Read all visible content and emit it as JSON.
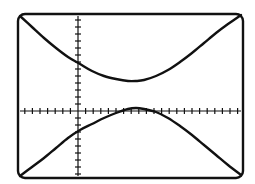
{
  "figure": {
    "kind": "graphing-calculator-screen",
    "title": "",
    "frame": {
      "x": 18,
      "y": 14,
      "width": 225,
      "height": 164,
      "corner_radius": 7,
      "stroke_color": "#111111",
      "stroke_width": 2.4,
      "fill_color": "#ffffff"
    },
    "background_color": "#ffffff",
    "curve_color": "#111111",
    "axis_color": "#111111"
  },
  "chart_data": {
    "type": "line",
    "title": "",
    "subtitle": "",
    "xlabel": "",
    "ylabel": "",
    "grid": false,
    "legend": "none",
    "axes": {
      "origin_px": {
        "x": 78,
        "y": 111
      },
      "x_axis": {
        "visible": true,
        "from_px": 20,
        "to_px": 241,
        "y_px": 111,
        "tick_spacing_px": 7.6,
        "tick_half_length_px": 3,
        "tick_count_left_of_origin": 7,
        "tick_count_right_of_origin": 21
      },
      "y_axis": {
        "visible": true,
        "x_px": 78,
        "from_px": 16,
        "to_px": 176,
        "tick_spacing_px": 7.0,
        "tick_half_length_px": 3,
        "tick_count_above_origin": 13,
        "tick_count_below_origin": 9
      },
      "xlim": [
        -7.6,
        21.4
      ],
      "ylim": [
        -9.3,
        13.6
      ]
    },
    "series": [
      {
        "name": "upper-branch",
        "comment": "upper branch of hyperbola, vertex near (135,81) px, rises to both frame corners",
        "points_px": [
          [
            20,
            16
          ],
          [
            32,
            27
          ],
          [
            44,
            38
          ],
          [
            56,
            48
          ],
          [
            68,
            57
          ],
          [
            80,
            64
          ],
          [
            92,
            71
          ],
          [
            104,
            76
          ],
          [
            116,
            79
          ],
          [
            128,
            81
          ],
          [
            136,
            81
          ],
          [
            144,
            80
          ],
          [
            156,
            76
          ],
          [
            168,
            70
          ],
          [
            180,
            62
          ],
          [
            192,
            53
          ],
          [
            204,
            43
          ],
          [
            216,
            33
          ],
          [
            228,
            24
          ],
          [
            241,
            15
          ]
        ]
      },
      {
        "name": "lower-branch",
        "comment": "lower branch of hyperbola, vertex near (133,108) px, descends to both frame corners",
        "points_px": [
          [
            20,
            176
          ],
          [
            32,
            167
          ],
          [
            44,
            158
          ],
          [
            56,
            148
          ],
          [
            68,
            138
          ],
          [
            80,
            130
          ],
          [
            92,
            124
          ],
          [
            104,
            118
          ],
          [
            116,
            113
          ],
          [
            128,
            109
          ],
          [
            136,
            108
          ],
          [
            144,
            109
          ],
          [
            156,
            112
          ],
          [
            168,
            118
          ],
          [
            180,
            126
          ],
          [
            192,
            135
          ],
          [
            204,
            145
          ],
          [
            216,
            155
          ],
          [
            228,
            165
          ],
          [
            241,
            175
          ]
        ]
      }
    ],
    "annotations": [],
    "tick_labels": {
      "x": [],
      "y": []
    }
  }
}
